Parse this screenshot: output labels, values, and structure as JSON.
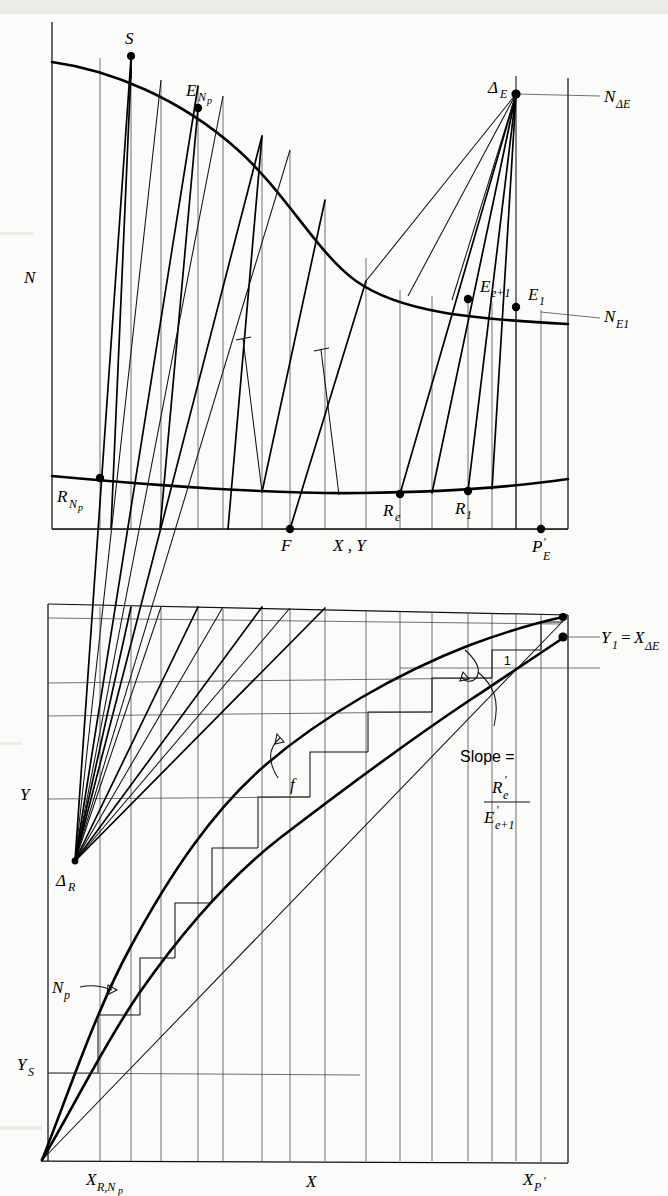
{
  "figure": {
    "type": "diagram",
    "kind": "ponchon-savarit-extraction-diagram"
  },
  "upper_panel": {
    "y_axis_label": "N",
    "x_axis_label": "X , Y",
    "points": [
      {
        "id": "S",
        "label": "S"
      },
      {
        "id": "E_Np",
        "label": "E",
        "sub": "N",
        "sub2": "p"
      },
      {
        "id": "Delta_E",
        "label": "Δ",
        "sub": "E"
      },
      {
        "id": "E_e1",
        "label": "E",
        "sub": "e+1"
      },
      {
        "id": "E_1",
        "label": "E",
        "sub": "1"
      },
      {
        "id": "R_Np",
        "label": "R",
        "sub": "N",
        "sub2": "p"
      },
      {
        "id": "R_e",
        "label": "R",
        "sub": "e"
      },
      {
        "id": "R_1",
        "label": "R",
        "sub": "1"
      },
      {
        "id": "F",
        "label": "F"
      },
      {
        "id": "P_E",
        "label": "P",
        "sub": "E",
        "prime": "′"
      }
    ],
    "right_axis_labels": [
      {
        "id": "N_DeltaE",
        "label": "N",
        "sub": "ΔE"
      },
      {
        "id": "N_E1",
        "label": "N",
        "sub": "E1"
      }
    ]
  },
  "lower_panel": {
    "y_axis_label": "Y",
    "x_axis_label": "X",
    "left_axis_labels": [
      {
        "id": "Y_S",
        "label": "Y",
        "sub": "S"
      }
    ],
    "right_axis_labels": [
      {
        "id": "Y1_eq_XDeltaE",
        "label": "Y",
        "sub": "1",
        "eq": "=",
        "rhs": "X",
        "rhs_sub": "ΔE"
      }
    ],
    "bottom_axis_labels": [
      {
        "id": "X_R_Np",
        "label": "X",
        "sub": "R,N",
        "sub2": "p"
      },
      {
        "id": "X_mid",
        "label": "X"
      },
      {
        "id": "X_P_E",
        "label": "X",
        "sub": "P",
        "prime": "′",
        "sub2": "E"
      }
    ],
    "inside_labels": [
      {
        "id": "Delta_R",
        "label": "Δ",
        "sub": "R"
      },
      {
        "id": "N_p",
        "label": "N",
        "sub": "p"
      },
      {
        "id": "stage_1",
        "label": "1"
      },
      {
        "id": "curve_f",
        "label": "f"
      }
    ],
    "slope_annotation": {
      "text": "Slope =",
      "numerator": "R",
      "numerator_sub": "e",
      "numerator_prime": "′",
      "denominator": "E",
      "denominator_sub": "e+1",
      "denominator_prime": "′"
    }
  },
  "colors": {
    "ink": "#000000",
    "paper": "#fbfbf9",
    "hairline": "#333333"
  }
}
